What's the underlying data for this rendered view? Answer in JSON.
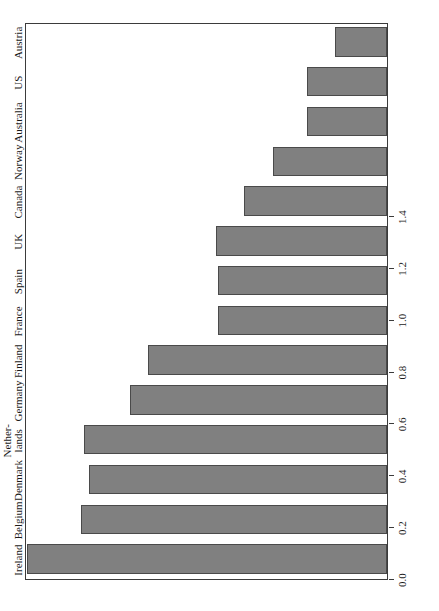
{
  "chart_data": {
    "type": "bar",
    "orientation": "rotated-90",
    "title": "",
    "subtitle": "",
    "xlabel": "",
    "ylabel": "",
    "categories": [
      "Ireland",
      "Belgium",
      "Denmark",
      "Nether-\nlands",
      "Germany",
      "Finland",
      "France",
      "Spain",
      "UK",
      "Canada",
      "Norway",
      "Australia",
      "US",
      "Austria"
    ],
    "values": [
      1.39,
      1.18,
      1.15,
      1.17,
      0.99,
      0.92,
      0.65,
      0.65,
      0.66,
      0.55,
      0.44,
      0.31,
      0.31,
      0.2
    ],
    "ylim": [
      0.0,
      1.4
    ],
    "tick_labels": [
      "0.0",
      "0.2",
      "0.4",
      "0.6",
      "0.8",
      "1.0",
      "1.2",
      "1.4"
    ],
    "tick_values": [
      0.0,
      0.2,
      0.4,
      0.6,
      0.8,
      1.0,
      1.2,
      1.4
    ],
    "grid": false,
    "legend": null,
    "bar_color": "#808080",
    "bar_edge_color": "#4a4a4a",
    "frame_color": "#3b3b3b",
    "background": "#ffffff"
  }
}
